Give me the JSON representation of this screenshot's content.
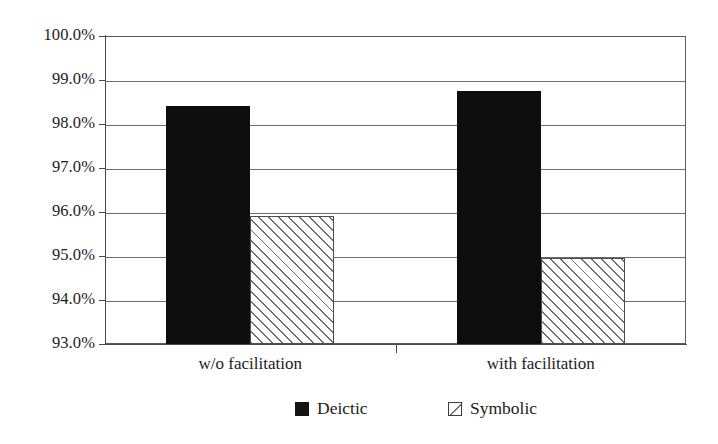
{
  "chart_data": {
    "type": "bar",
    "title": "",
    "subtitle": "",
    "xlabel": "",
    "ylabel": "",
    "categories": [
      "w/o facilitation",
      "with facilitation"
    ],
    "series": [
      {
        "name": "Deictic",
        "values": [
          98.4,
          98.75
        ],
        "fill": "solid",
        "color": "#0d0d0d"
      },
      {
        "name": "Symbolic",
        "values": [
          95.9,
          94.95
        ],
        "fill": "hatched",
        "color": "#ffffff"
      }
    ],
    "ylim": [
      93.0,
      100.0
    ],
    "ytick_values": [
      93.0,
      94.0,
      95.0,
      96.0,
      97.0,
      98.0,
      99.0,
      100.0
    ],
    "ytick_labels": [
      "93.0%",
      "94.0%",
      "95.0%",
      "96.0%",
      "97.0%",
      "98.0%",
      "99.0%",
      "100.0%"
    ],
    "ytick_format": "percent",
    "grid": true,
    "grid_axis": "y",
    "legend_position": "bottom",
    "legend_entries": [
      "Deictic",
      "Symbolic"
    ],
    "plot_background": "#ffffff",
    "grid_color": "#6d6d6d",
    "axis_color": "#4a4a4a"
  }
}
